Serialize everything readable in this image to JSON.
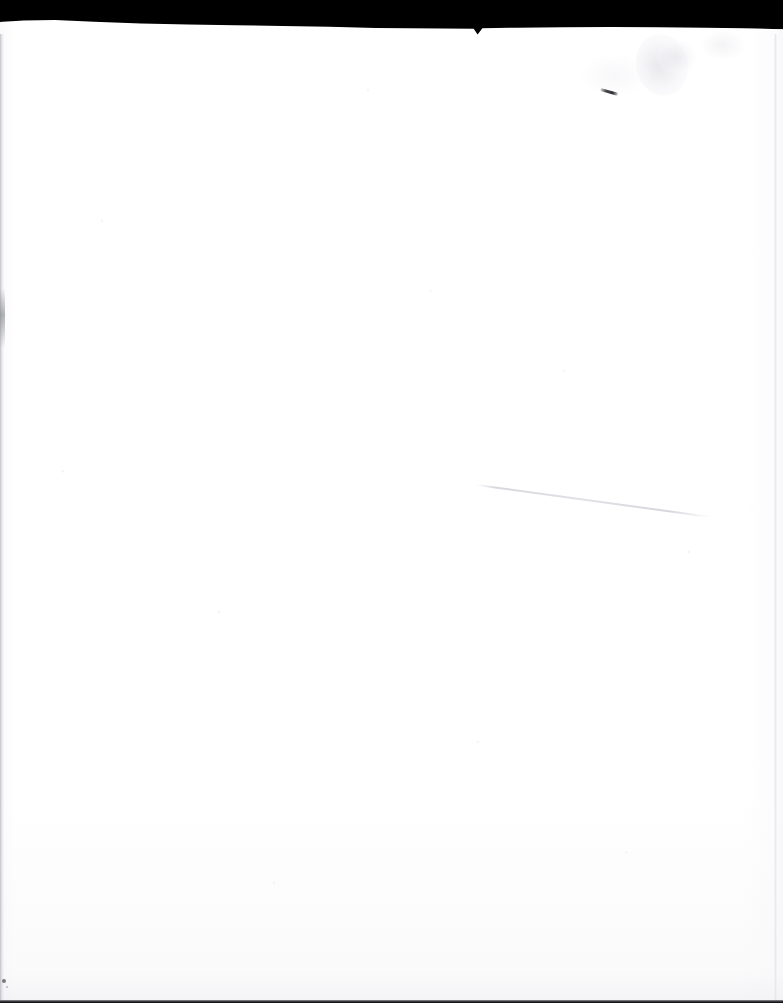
{
  "document": {
    "kind": "scanned-page",
    "content_description": "Blank scanned page — no printed or handwritten text present",
    "page_text": "",
    "width_px": 783,
    "height_px": 1003
  },
  "colors": {
    "scanner_bed": "#000000",
    "paper": "#ffffff",
    "paper_shadow": "#e8e9ec",
    "edge_line": "#a8aab0",
    "crease_line": "#d6d7dc",
    "pen_mark": "#3a3a40",
    "bottom_rule": "#19191c",
    "speck": "#50505 6"
  },
  "regions": {
    "scanner_band": {
      "name": "scanner-bed-band",
      "label": "Black scanner bed band across the top",
      "top_px": 0,
      "height_px": 34
    },
    "paper_sheet": {
      "name": "paper-sheet",
      "label": "White paper sheet",
      "top_px": 22,
      "height_px": 981
    },
    "left_edge": {
      "name": "paper-left-edge",
      "label": "Faint grey shadow line along the left paper edge"
    },
    "right_edge": {
      "name": "paper-right-edge",
      "label": "Faint tonal edge along the right side of the sheet"
    },
    "bottom_edge": {
      "name": "paper-bottom-edge",
      "label": "Thin dark rule along the bottom edge of the scan"
    }
  },
  "marks": [
    {
      "name": "crease-line",
      "label": "Faint diagonal crease / fold shadow",
      "x_px": 477,
      "y_px": 484,
      "length_px": 236,
      "angle_deg": 7.8
    },
    {
      "name": "pen-dash-mark",
      "label": "Small dark slanted pen dash",
      "x_px": 601,
      "y_px": 88,
      "length_px": 18,
      "angle_deg": 16
    },
    {
      "name": "smudge-top-right",
      "label": "Faint mottled grey smudge in the upper-right area",
      "x_px": 636,
      "y_px": 34
    },
    {
      "name": "dust-speck-bottom-left",
      "label": "Tiny dark dust speck near the bottom-left corner",
      "x_px": 2,
      "y_px": 979
    }
  ]
}
